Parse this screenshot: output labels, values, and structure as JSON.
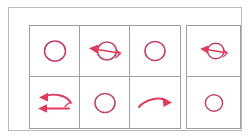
{
  "figure": {
    "colors": {
      "stroke_circle": "#c0456e",
      "stroke_arrow": "#e03a5f",
      "grid_line": "#9f9f9f",
      "outer_frame": "#b9b9b9",
      "background": "#ffffff"
    },
    "layout": {
      "rows": 2,
      "columns": 4,
      "note": "Columns 1-3 share one bordered table; column 4 is a separate bordered box set apart by a gap."
    },
    "cells": [
      {
        "id": "r1c1",
        "row": 1,
        "column": 1,
        "symbol": "circle",
        "label": "Circle",
        "group": "main"
      },
      {
        "id": "r1c2",
        "row": 1,
        "column": 2,
        "symbol": "circle-with-arrow-left",
        "label": "Circle with leftward arrow through it",
        "group": "main"
      },
      {
        "id": "r1c3",
        "row": 1,
        "column": 3,
        "symbol": "circle",
        "label": "Circle",
        "group": "main"
      },
      {
        "id": "r1c4",
        "row": 1,
        "column": 4,
        "symbol": "circle-with-arrow-left",
        "label": "Circle with leftward arrow through it",
        "group": "side"
      },
      {
        "id": "r2c1",
        "row": 2,
        "column": 1,
        "symbol": "curved-arrow-left-and-straight-arrow-left",
        "label": "Curved arrow left above a straight arrow left",
        "group": "main"
      },
      {
        "id": "r2c2",
        "row": 2,
        "column": 2,
        "symbol": "circle",
        "label": "Circle",
        "group": "main"
      },
      {
        "id": "r2c3",
        "row": 2,
        "column": 3,
        "symbol": "curved-arrow-right",
        "label": "Curved arrow pointing right",
        "group": "main"
      },
      {
        "id": "r2c4",
        "row": 2,
        "column": 4,
        "symbol": "circle",
        "label": "Circle",
        "group": "side"
      }
    ]
  }
}
